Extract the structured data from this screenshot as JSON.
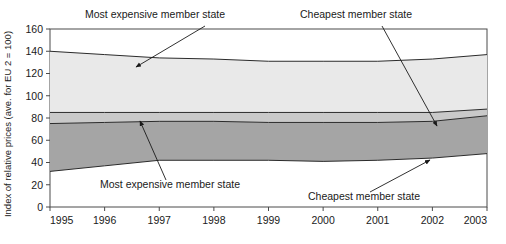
{
  "chart_data": {
    "type": "area",
    "title": "",
    "xlabel": "",
    "ylabel": "Index of relative prices (ave. for EU 2 = 100)",
    "x": [
      1995,
      1996,
      1997,
      1998,
      1999,
      2000,
      2001,
      2002,
      2003
    ],
    "xtick_labels": [
      "1995",
      "1996",
      "1997",
      "1998",
      "1999",
      "2000",
      "2001",
      "2002",
      "2003"
    ],
    "ytick_labels": [
      "0",
      "20",
      "40",
      "60",
      "80",
      "100",
      "120",
      "140",
      "160"
    ],
    "yticks": [
      0,
      20,
      40,
      60,
      80,
      100,
      120,
      140,
      160
    ],
    "ylim": [
      0,
      160
    ],
    "xlim": [
      1995,
      2003
    ],
    "grid": false,
    "legend": "none",
    "series": [
      {
        "name": "Most expensive member state (upper band top)",
        "values": [
          140,
          137,
          134,
          133,
          131,
          131,
          131,
          133,
          137
        ]
      },
      {
        "name": "Upper band base",
        "values": [
          85,
          85,
          85,
          85,
          85,
          85,
          85,
          85,
          88
        ]
      },
      {
        "name": "Most expensive member state (lower band top)",
        "values": [
          75,
          76,
          77,
          77,
          76,
          76,
          76,
          77,
          82
        ]
      },
      {
        "name": "Cheapest member state (lower band base)",
        "values": [
          32,
          37,
          42,
          42,
          42,
          41,
          42,
          44,
          48
        ]
      }
    ],
    "band_colors": {
      "upper_band": "#e9e9e9",
      "mid_band": "#c9c9c9",
      "lower_band": "#a5a5a5",
      "line": "#2b2b2b",
      "axis": "#4a4a4a"
    },
    "annotations": [
      {
        "id": "most-expensive-top",
        "text": "Most expensive member state",
        "label_x": 85,
        "label_y": 18,
        "arrow_from_x": 205,
        "arrow_from_y": 26,
        "arrow_to_x": 136,
        "arrow_to_y": 67
      },
      {
        "id": "cheapest-top",
        "text": "Cheapest member state",
        "label_x": 300,
        "label_y": 18,
        "arrow_from_x": 382,
        "arrow_from_y": 26,
        "arrow_to_x": 437,
        "arrow_to_y": 126
      },
      {
        "id": "most-expensive-bottom",
        "text": "Most expensive member state",
        "label_x": 100,
        "label_y": 188,
        "arrow_from_x": 166,
        "arrow_from_y": 180,
        "arrow_to_x": 140,
        "arrow_to_y": 121
      },
      {
        "id": "cheapest-bottom",
        "text": "Cheapest member state",
        "label_x": 308,
        "label_y": 200,
        "arrow_from_x": 370,
        "arrow_from_y": 192,
        "arrow_to_x": 430,
        "arrow_to_y": 160
      }
    ],
    "caption_fragment": ""
  }
}
